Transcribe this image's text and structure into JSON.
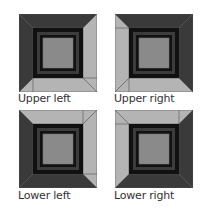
{
  "colors": {
    "dark_band": "#3a3a3a",
    "light_band": "#b4b4b4",
    "black_ring": "#111111",
    "inner_ring": "#3c3c3c",
    "center": "#8a8a8a",
    "outline": "#555555"
  },
  "tiles": [
    {
      "id": "upper-left",
      "label": "Upper left",
      "light_corner": "lower-right"
    },
    {
      "id": "upper-right",
      "label": "Upper right",
      "light_corner": "lower-left"
    },
    {
      "id": "lower-left",
      "label": "Lower left",
      "light_corner": "upper-right"
    },
    {
      "id": "lower-right",
      "label": "Lower right",
      "light_corner": "upper-left"
    }
  ]
}
